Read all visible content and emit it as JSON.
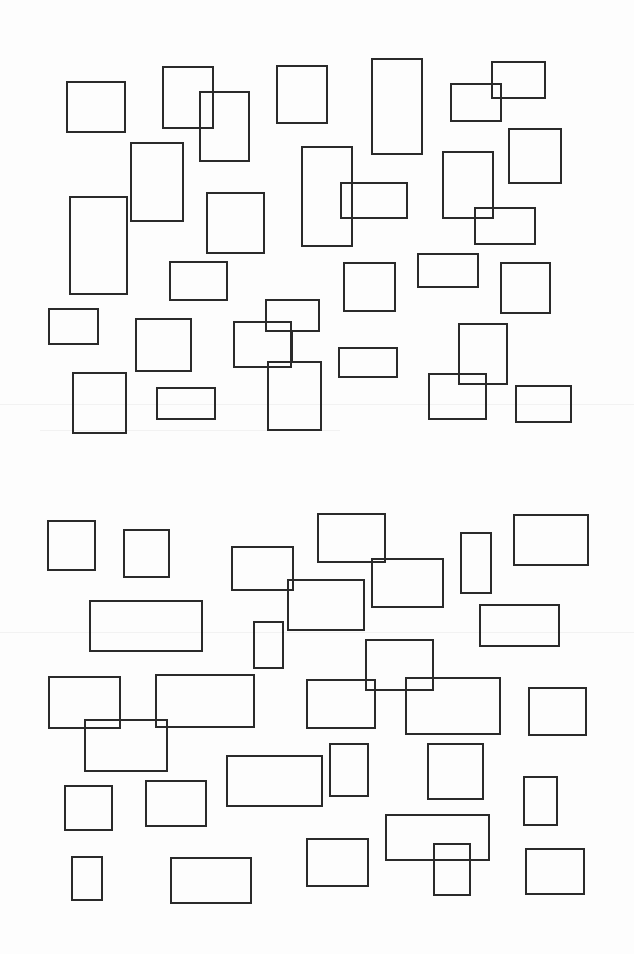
{
  "figure": {
    "width": 634,
    "height": 954,
    "stroke_color": "#2a2a2a",
    "stroke_width": 2,
    "background": "#fdfdfd",
    "panels": [
      {
        "name": "top-panel",
        "rects": [
          [
            67,
            82,
            58,
            50
          ],
          [
            163,
            67,
            50,
            61
          ],
          [
            200,
            92,
            49,
            69
          ],
          [
            277,
            66,
            50,
            57
          ],
          [
            131,
            143,
            52,
            78
          ],
          [
            207,
            193,
            57,
            60
          ],
          [
            70,
            197,
            57,
            97
          ],
          [
            372,
            59,
            50,
            95
          ],
          [
            451,
            84,
            50,
            37
          ],
          [
            492,
            62,
            53,
            36
          ],
          [
            302,
            147,
            50,
            99
          ],
          [
            341,
            183,
            66,
            35
          ],
          [
            509,
            129,
            52,
            54
          ],
          [
            443,
            152,
            50,
            66
          ],
          [
            475,
            208,
            60,
            36
          ],
          [
            170,
            262,
            57,
            38
          ],
          [
            49,
            309,
            49,
            35
          ],
          [
            136,
            319,
            55,
            52
          ],
          [
            234,
            322,
            57,
            45
          ],
          [
            266,
            300,
            53,
            31
          ],
          [
            268,
            362,
            53,
            68
          ],
          [
            73,
            373,
            53,
            60
          ],
          [
            157,
            388,
            58,
            31
          ],
          [
            344,
            263,
            51,
            48
          ],
          [
            418,
            254,
            60,
            33
          ],
          [
            501,
            263,
            49,
            50
          ],
          [
            339,
            348,
            58,
            29
          ],
          [
            429,
            374,
            57,
            45
          ],
          [
            459,
            324,
            48,
            60
          ],
          [
            516,
            386,
            55,
            36
          ]
        ],
        "connectors": [
          [
            292,
            331,
            292,
            362
          ]
        ]
      },
      {
        "name": "bottom-panel",
        "rects": [
          [
            48,
            521,
            47,
            49
          ],
          [
            124,
            530,
            45,
            47
          ],
          [
            232,
            547,
            61,
            43
          ],
          [
            288,
            580,
            76,
            50
          ],
          [
            318,
            514,
            67,
            48
          ],
          [
            372,
            559,
            71,
            48
          ],
          [
            461,
            533,
            30,
            60
          ],
          [
            514,
            515,
            74,
            50
          ],
          [
            90,
            601,
            112,
            50
          ],
          [
            254,
            622,
            29,
            46
          ],
          [
            480,
            605,
            79,
            41
          ],
          [
            49,
            677,
            71,
            51
          ],
          [
            156,
            675,
            98,
            52
          ],
          [
            85,
            720,
            82,
            51
          ],
          [
            366,
            640,
            67,
            50
          ],
          [
            307,
            680,
            68,
            48
          ],
          [
            406,
            678,
            94,
            56
          ],
          [
            529,
            688,
            57,
            47
          ],
          [
            65,
            786,
            47,
            44
          ],
          [
            146,
            781,
            60,
            45
          ],
          [
            227,
            756,
            95,
            50
          ],
          [
            330,
            744,
            38,
            52
          ],
          [
            428,
            744,
            55,
            55
          ],
          [
            524,
            777,
            33,
            48
          ],
          [
            386,
            815,
            103,
            45
          ],
          [
            434,
            844,
            36,
            51
          ],
          [
            72,
            857,
            30,
            43
          ],
          [
            171,
            858,
            80,
            45
          ],
          [
            307,
            839,
            61,
            47
          ],
          [
            526,
            849,
            58,
            45
          ]
        ],
        "connectors": [
          [
            375,
            690,
            406,
            690
          ]
        ]
      }
    ],
    "scan_artifacts": [
      {
        "y": 404,
        "x": 0,
        "w": 634
      },
      {
        "y": 430,
        "x": 40,
        "w": 300
      },
      {
        "y": 632,
        "x": 0,
        "w": 634
      }
    ]
  }
}
